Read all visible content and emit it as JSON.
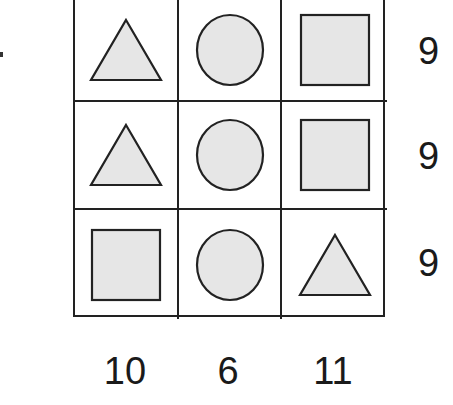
{
  "puzzle": {
    "grid": [
      [
        "triangle",
        "circle",
        "square"
      ],
      [
        "triangle",
        "circle",
        "square"
      ],
      [
        "square",
        "circle",
        "triangle"
      ]
    ],
    "row_sums": [
      "9",
      "9",
      "9"
    ],
    "column_sums": [
      "10",
      "6",
      "11"
    ]
  },
  "colors": {
    "shape_fill": "#e6e6e6",
    "stroke": "#222222",
    "background": "#ffffff"
  }
}
